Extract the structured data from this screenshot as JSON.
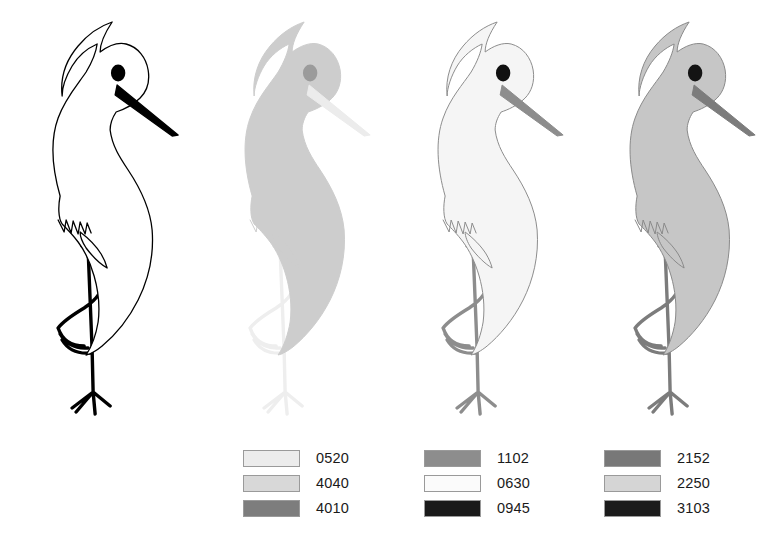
{
  "figure": {
    "title": "",
    "background": "#ffffff",
    "variant_count": 4
  },
  "birds": [
    {
      "id": "bird-1",
      "name": "bird-outline-black",
      "body_fill": "#ffffff",
      "outline": "#000000",
      "outline_width": "1.3",
      "beak_fill": "#000000",
      "beak_outline": "#000000",
      "eye_fill": "#000000",
      "leg_fill": "#000000",
      "leg_outline": "#000000"
    },
    {
      "id": "bird-2",
      "name": "bird-silhouette-light-grey",
      "body_fill": "#cdcdcd",
      "outline": "#cdcdcd",
      "outline_width": "1.0",
      "beak_fill": "#ececec",
      "beak_outline": "#ececec",
      "eye_fill": "#9b9b9b",
      "leg_fill": "#eeeeee",
      "leg_outline": "#eeeeee"
    },
    {
      "id": "bird-3",
      "name": "bird-near-white-grey-beak",
      "body_fill": "#f5f5f5",
      "outline": "#8d8d8d",
      "outline_width": "1.0",
      "beak_fill": "#8d8d8d",
      "beak_outline": "#8d8d8d",
      "eye_fill": "#111111",
      "leg_fill": "#8d8d8d",
      "leg_outline": "#8d8d8d"
    },
    {
      "id": "bird-4",
      "name": "bird-medium-grey",
      "body_fill": "#c6c6c6",
      "outline": "#8a8a8a",
      "outline_width": "1.0",
      "beak_fill": "#7c7c7c",
      "beak_outline": "#7c7c7c",
      "eye_fill": "#141414",
      "leg_fill": "#7c7c7c",
      "leg_outline": "#7c7c7c"
    }
  ],
  "legends": [
    {
      "id": "legend-1",
      "items": [
        {
          "code": "0520",
          "color": "#ececec"
        },
        {
          "code": "4040",
          "color": "#d8d8d8"
        },
        {
          "code": "4010",
          "color": "#7d7d7d"
        }
      ]
    },
    {
      "id": "legend-2",
      "items": [
        {
          "code": "1102",
          "color": "#8d8d8d"
        },
        {
          "code": "0630",
          "color": "#fbfbfb"
        },
        {
          "code": "0945",
          "color": "#1a1a1a"
        }
      ]
    },
    {
      "id": "legend-3",
      "items": [
        {
          "code": "2152",
          "color": "#787878"
        },
        {
          "code": "2250",
          "color": "#d5d5d5"
        },
        {
          "code": "3103",
          "color": "#1b1b1b"
        }
      ]
    }
  ]
}
